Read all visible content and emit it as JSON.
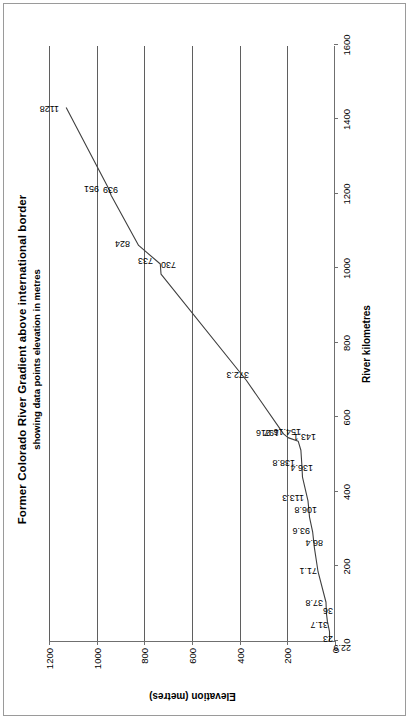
{
  "chart_data": {
    "type": "line",
    "title": "Former Colorado River Gradient above international border",
    "subtitle": "showing data points elevation in metres",
    "xlabel": "River kilometres",
    "ylabel": "Elevation (metres)",
    "xlim": [
      0,
      1600
    ],
    "ylim": [
      0,
      1200
    ],
    "xticks": [
      0,
      200,
      400,
      600,
      800,
      1000,
      1200,
      1400,
      1600
    ],
    "yticks": [
      0,
      200,
      400,
      600,
      800,
      1000,
      1200
    ],
    "grid": "horizontal",
    "legend": "none",
    "series_name": "Colorado River gradient",
    "line_color": "#3f3f3f",
    "x": [
      0,
      25,
      52,
      74,
      104,
      186,
      250,
      292,
      332,
      376,
      440,
      470,
      512,
      536,
      546,
      556,
      700,
      985,
      1012,
      1062,
      1196,
      1216,
      1432
    ],
    "y": [
      22.9,
      23,
      31.7,
      36,
      37.8,
      71.1,
      86.4,
      93.6,
      106.8,
      113.3,
      136.4,
      138.8,
      143.1,
      154.16,
      197,
      216,
      372.3,
      730,
      733,
      824,
      939,
      951,
      1128
    ],
    "point_labels": [
      "22.9",
      "23",
      "31.7",
      "36",
      "37.8",
      "71.1",
      "86.4",
      "93.6",
      "106.8",
      "113.3",
      "136.4",
      "138.8",
      "143.1",
      "154.16",
      "197",
      "216",
      "372.3",
      "730",
      "733",
      "824",
      "939",
      "951",
      "1128"
    ]
  },
  "figure": {
    "border_color": "#9a9a9a",
    "background": "#ffffff"
  }
}
